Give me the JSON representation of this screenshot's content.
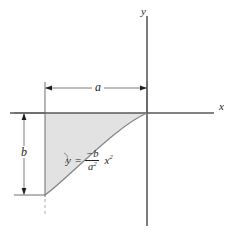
{
  "figure": {
    "type": "cartesian-plot",
    "title": "",
    "background_color": "#ffffff",
    "line_color": "#231f20",
    "fill_color": "#e2e2e2",
    "axes": {
      "x_label": "x",
      "y_label": "y",
      "origin_px": [
        147,
        113
      ],
      "x_axis_span_px": [
        10,
        214
      ],
      "y_axis_span_px": [
        16,
        226
      ]
    },
    "curve": {
      "equation_text": "y = -b/a^2 x^2",
      "lhs": "y",
      "equal_sign": "=",
      "numerator": "−b",
      "denominator_base": "a",
      "denominator_exponent": "2",
      "variable": "x",
      "variable_exponent": "2",
      "domain": "-a ≤ x ≤ 0",
      "vertex_px": [
        147,
        113
      ],
      "endpoint_px": [
        45,
        195
      ]
    },
    "shaded_region": {
      "name": "area-under-parabola",
      "fill": "#e2e2e2",
      "bounds_px": {
        "left": 45,
        "right": 147,
        "top": 113,
        "bottom": 195
      }
    },
    "dimensions": [
      {
        "name": "a",
        "label": "a",
        "orientation": "horizontal",
        "y_px": 88,
        "from_px": 45,
        "to_px": 147,
        "label_pos_px": [
          97,
          88
        ]
      },
      {
        "name": "b",
        "label": "b",
        "orientation": "vertical",
        "x_px": 24,
        "from_px": 113,
        "to_px": 195,
        "label_pos_px": [
          24,
          153
        ]
      }
    ],
    "guides": [
      {
        "name": "left-extension-line",
        "type": "solid",
        "x_px": 45,
        "from_y_px": 82,
        "to_y_px": 197
      },
      {
        "name": "left-dashed-tail",
        "type": "dashed",
        "x_px": 45,
        "from_y_px": 199,
        "to_y_px": 215
      },
      {
        "name": "origin-extension-line",
        "type": "solid",
        "x_px": 147,
        "from_y_px": 82,
        "to_y_px": 113
      },
      {
        "name": "b-upper-extension",
        "type": "solid",
        "y_px": 113,
        "from_x_px": 14,
        "to_x_px": 45
      },
      {
        "name": "b-lower-extension",
        "type": "solid",
        "y_px": 195,
        "from_x_px": 14,
        "to_x_px": 45
      }
    ]
  }
}
